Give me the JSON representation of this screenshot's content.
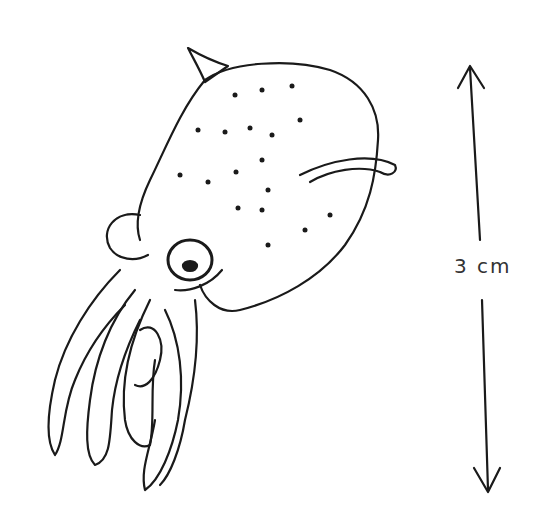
{
  "image": {
    "subject": "hand-drawn sketch of a squid",
    "ink_color": "#1a1a1a",
    "background": "#ffffff"
  },
  "scale_bar": {
    "label": "3 cm",
    "orientation": "vertical",
    "arrowheads": "both ends"
  }
}
